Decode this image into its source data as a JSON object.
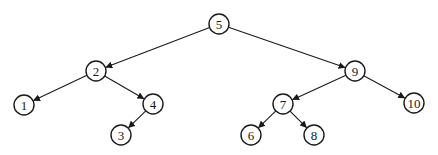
{
  "diagram": {
    "type": "binary-search-tree",
    "root": "5",
    "nodes": [
      {
        "id": "5",
        "label": "5",
        "x": 219,
        "y": 24
      },
      {
        "id": "2",
        "label": "2",
        "x": 96,
        "y": 71
      },
      {
        "id": "9",
        "label": "9",
        "x": 355,
        "y": 71
      },
      {
        "id": "1",
        "label": "1",
        "x": 24,
        "y": 105
      },
      {
        "id": "4",
        "label": "4",
        "x": 153,
        "y": 104
      },
      {
        "id": "3",
        "label": "3",
        "x": 121,
        "y": 135
      },
      {
        "id": "7",
        "label": "7",
        "x": 283,
        "y": 104
      },
      {
        "id": "10",
        "label": "10",
        "x": 414,
        "y": 103
      },
      {
        "id": "6",
        "label": "6",
        "x": 251,
        "y": 135
      },
      {
        "id": "8",
        "label": "8",
        "x": 314,
        "y": 135
      }
    ],
    "edges": [
      {
        "from": "5",
        "to": "2"
      },
      {
        "from": "5",
        "to": "9"
      },
      {
        "from": "2",
        "to": "1"
      },
      {
        "from": "2",
        "to": "4"
      },
      {
        "from": "4",
        "to": "3"
      },
      {
        "from": "9",
        "to": "7"
      },
      {
        "from": "9",
        "to": "10"
      },
      {
        "from": "7",
        "to": "6"
      },
      {
        "from": "7",
        "to": "8"
      }
    ],
    "node_radius": 10,
    "colors": {
      "stroke": "#1a1a1a",
      "fill": "#ffffff",
      "background": "#ffffff"
    }
  }
}
